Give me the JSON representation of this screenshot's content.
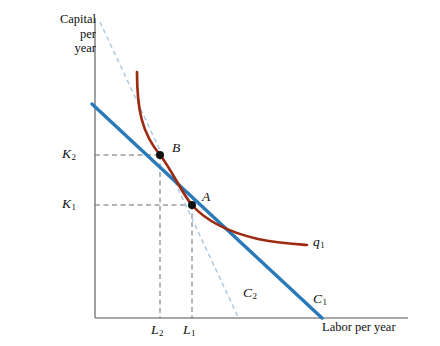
{
  "figure": {
    "type": "isoquant-isocost-diagram",
    "axes": {
      "y_title": "Capital\nper\nyear",
      "y_title_lines": [
        "Capital",
        "per",
        "year"
      ],
      "x_title": "Labor per year",
      "origin_px": [
        95,
        318
      ],
      "axis_color": "#8a8a8a"
    },
    "ticks": {
      "y": [
        {
          "name": "K2",
          "text": "K",
          "sub": "2",
          "value_px_y": 155
        },
        {
          "name": "K1",
          "text": "K",
          "sub": "1",
          "value_px_y": 205
        }
      ],
      "x": [
        {
          "name": "L2",
          "text": "L",
          "sub": "2",
          "value_px_x": 160
        },
        {
          "name": "L1",
          "text": "L",
          "sub": "1",
          "value_px_x": 192
        }
      ]
    },
    "points": [
      {
        "name": "B",
        "label": "B",
        "x_px": 160,
        "y_px": 155,
        "on": [
          "isoquant-q1",
          "isocost-c1"
        ]
      },
      {
        "name": "A",
        "label": "A",
        "x_px": 192,
        "y_px": 205,
        "on": [
          "isoquant-q1",
          "isocost-c2"
        ],
        "tangency": true
      }
    ],
    "curves": [
      {
        "name": "isoquant-q1",
        "label": "q",
        "label_sub": "1",
        "color": "#9d2b12",
        "style": "solid",
        "width": 2.6
      },
      {
        "name": "isocost-c1",
        "label": "C",
        "label_sub": "1",
        "color": "#2a7ab9",
        "style": "solid",
        "width": 3.2
      },
      {
        "name": "isocost-c2",
        "label": "C",
        "label_sub": "2",
        "color": "#9fc4de",
        "style": "dashed",
        "width": 1.2
      }
    ],
    "guides": {
      "color": "#666666",
      "style": "dashed",
      "lines": [
        {
          "name": "guide-k2",
          "from_px": [
            95,
            155
          ],
          "to_px": [
            160,
            155
          ]
        },
        {
          "name": "guide-k1",
          "from_px": [
            95,
            205
          ],
          "to_px": [
            192,
            205
          ]
        },
        {
          "name": "guide-l2",
          "from_px": [
            160,
            155
          ],
          "to_px": [
            160,
            318
          ]
        },
        {
          "name": "guide-l1",
          "from_px": [
            192,
            205
          ],
          "to_px": [
            192,
            318
          ]
        }
      ]
    }
  }
}
